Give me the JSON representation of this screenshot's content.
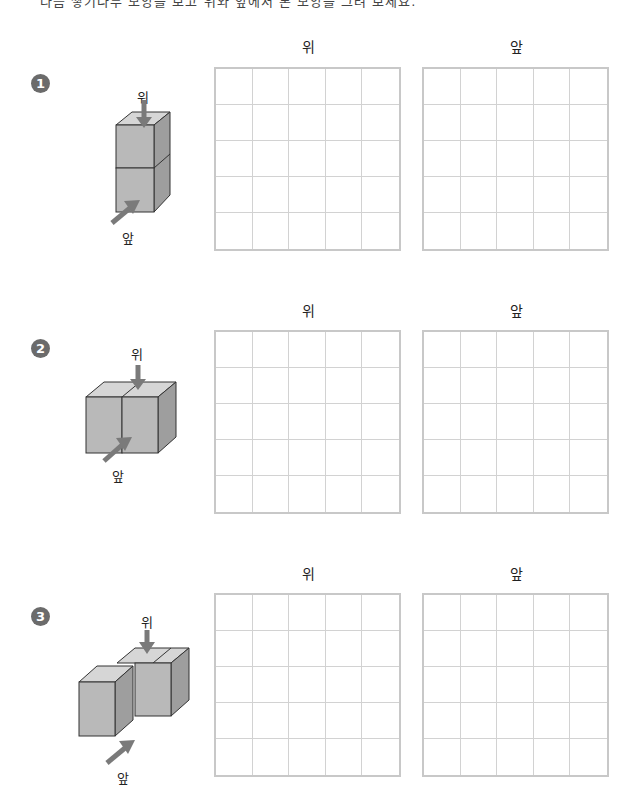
{
  "header": {
    "cut_off_text": "다음 쌓기나무 모양을 보고 위와 앞에서 본 모양을 그려 보세요."
  },
  "labels": {
    "top": "위",
    "front": "앞"
  },
  "grid": {
    "rows": 5,
    "cols": 5
  },
  "problems": [
    {
      "number": "1",
      "shape": "two cubes stacked vertically",
      "view_labels": {
        "top": "위",
        "front": "앞"
      },
      "grid_titles": {
        "top": "위",
        "front": "앞"
      }
    },
    {
      "number": "2",
      "shape": "two cubes side by side",
      "view_labels": {
        "top": "위",
        "front": "앞"
      },
      "grid_titles": {
        "top": "위",
        "front": "앞"
      }
    },
    {
      "number": "3",
      "shape": "three cubes in L shape",
      "view_labels": {
        "top": "위",
        "front": "앞"
      },
      "grid_titles": {
        "top": "위",
        "front": "앞"
      }
    }
  ],
  "colors": {
    "cube_front": "#b9b9b9",
    "cube_top": "#d6d6d6",
    "cube_side": "#9e9e9e",
    "arrow": "#7a7a7a",
    "grid_line": "#d2d2d2",
    "grid_border": "#c8c8c8",
    "badge": "#6b6b6b"
  }
}
